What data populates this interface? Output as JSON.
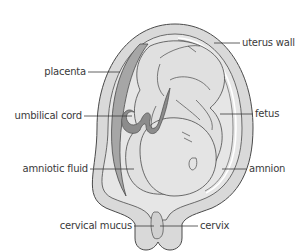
{
  "diagram": {
    "labels": {
      "placenta": "placenta",
      "umbilical_cord": "umbilical cord",
      "amniotic_fluid": "amniotic fluid",
      "cervical_mucus": "cervical mucus",
      "uterus_wall": "uterus wall",
      "fetus": "fetus",
      "amnion": "amnion",
      "cervix": "cervix"
    },
    "colors": {
      "uterus_wall": "#d9d9d9",
      "placenta": "#a6a6a6",
      "amniotic_fluid": "#e6e6e6",
      "fetus": "#e0e0e0",
      "umbilical_cord": "#8c8c8c",
      "outline": "#4a4a4a",
      "amnion": "#ffffff",
      "label_text": "#3a3a3a"
    }
  }
}
